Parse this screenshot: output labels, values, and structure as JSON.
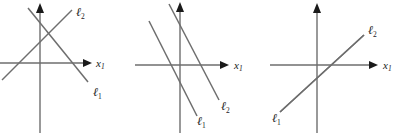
{
  "figure": {
    "background_color": "#ffffff",
    "line_color": "#6e6e6e",
    "label_color": "#1a1a1a",
    "axis_label": "x",
    "axis_label_subscript": "1",
    "line_label_symbol": "ℓ",
    "panel_count": 3
  },
  "panels": [
    {
      "id": "panel-one-unique-solution",
      "description": "two intersecting lines",
      "case": "unique solution",
      "axes": {
        "x_label": "x",
        "x_label_sub": "1",
        "y_label": "",
        "x_axis": {
          "x1": 0,
          "y1": 63,
          "x2": 88,
          "y2": 63
        },
        "y_axis": {
          "x1": 40,
          "y1": 133,
          "x2": 40,
          "y2": 6
        }
      },
      "lines": [
        {
          "name": "ℓ",
          "sub": "1",
          "slope_sign": "negative",
          "x1": 28,
          "y1": 8,
          "x2": 88,
          "y2": 82,
          "label_x": 93,
          "label_y": 93
        },
        {
          "name": "ℓ",
          "sub": "2",
          "slope_sign": "positive",
          "x1": 2,
          "y1": 80,
          "x2": 72,
          "y2": 10,
          "label_x": 74,
          "label_y": 13
        }
      ]
    },
    {
      "id": "panel-two-no-solution",
      "description": "two parallel lines",
      "case": "no solution",
      "axes": {
        "x_label": "x",
        "x_label_sub": "1",
        "y_label": "",
        "x_axis": {
          "x1": 0,
          "y1": 65,
          "x2": 90,
          "y2": 65
        },
        "y_axis": {
          "x1": 45,
          "y1": 133,
          "x2": 45,
          "y2": 4
        }
      },
      "lines": [
        {
          "name": "ℓ",
          "sub": "1",
          "slope_sign": "negative",
          "x1": 14,
          "y1": 21,
          "x2": 62,
          "y2": 116,
          "label_x": 66,
          "label_y": 119
        },
        {
          "name": "ℓ",
          "sub": "2",
          "slope_sign": "negative",
          "x1": 34,
          "y1": 4,
          "x2": 84,
          "y2": 100,
          "label_x": 88,
          "label_y": 103
        }
      ]
    },
    {
      "id": "panel-three-infinitely-many",
      "description": "two coincident lines",
      "case": "infinitely many solutions",
      "axes": {
        "x_label": "x",
        "x_label_sub": "1",
        "y_label": "",
        "x_axis": {
          "x1": 0,
          "y1": 65,
          "x2": 104,
          "y2": 65
        },
        "y_axis": {
          "x1": 47,
          "y1": 133,
          "x2": 47,
          "y2": 5
        }
      },
      "lines": [
        {
          "name": "ℓ",
          "sub": "1",
          "slope_sign": "positive",
          "x1": 10,
          "y1": 112,
          "x2": 94,
          "y2": 35,
          "label_x": 2,
          "label_y": 117
        },
        {
          "name": "ℓ",
          "sub": "2",
          "slope_sign": "positive",
          "x1": 10,
          "y1": 112,
          "x2": 94,
          "y2": 35,
          "label_x": 97,
          "label_y": 31
        }
      ]
    }
  ]
}
